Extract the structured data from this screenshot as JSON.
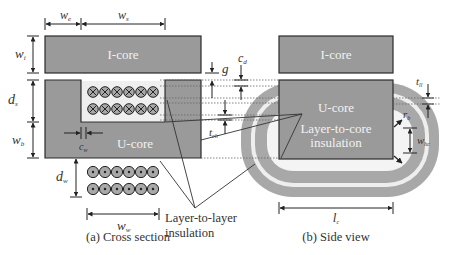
{
  "colors": {
    "core_fill": "#9a9a9a",
    "core_stroke": "#2a2a2a",
    "winding_fill": "#a8a8a8",
    "insulation_light": "#f0f0f0",
    "line": "#222222",
    "text": "#333333"
  },
  "cross_section": {
    "caption": "(a) Cross section",
    "icore_label": "I-core",
    "ucore_label": "U-core",
    "dims": {
      "we": "w",
      "we_sub": "e",
      "ws": "w",
      "ws_sub": "s",
      "wi": "w",
      "wi_sub": "i",
      "ds": "d",
      "ds_sub": "s",
      "wb": "w",
      "wb_sub": "b",
      "cw": "c",
      "cw_sub": "w",
      "dw": "d",
      "dw_sub": "w",
      "ww": "w",
      "ww_sub": "w",
      "g": "g",
      "cd": "c",
      "cd_sub": "d",
      "tclr": "t",
      "tclr_sub": "clr"
    },
    "winding_rows_into_page": 2,
    "winding_rows_out_of_page": 2,
    "conductors_per_row": 6,
    "annotation": {
      "line1": "Layer-to-layer",
      "line2": "insulation"
    }
  },
  "side_view": {
    "caption": "(b) Side view",
    "icore_label": "I-core",
    "ucore_label": "U-core",
    "annotation": {
      "line1": "Layer-to-core",
      "line2": "insulation"
    },
    "dims": {
      "tll": "t",
      "tll_sub": "ll",
      "rb": "r",
      "rb_sub": "b",
      "whc": "w",
      "whc_sub": "hc",
      "lc": "l",
      "lc_sub": "c"
    }
  }
}
